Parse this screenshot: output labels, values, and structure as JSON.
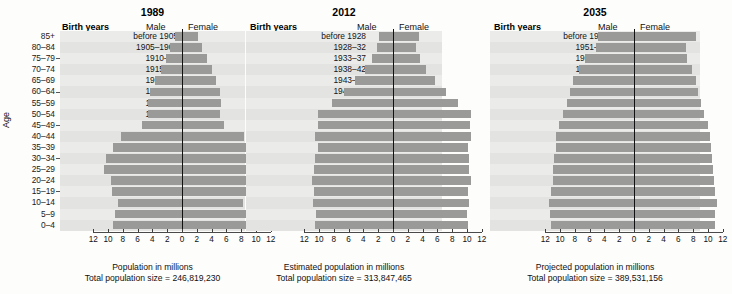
{
  "figure": {
    "y_axis_label": "Age",
    "age_groups": [
      "85+",
      "80–84",
      "75–79",
      "70–74",
      "65–69",
      "60–64",
      "55–59",
      "50–54",
      "45–49",
      "40–44",
      "35–39",
      "30–34",
      "25–29",
      "20–24",
      "15–19",
      "10–14",
      "5–9",
      "0–4"
    ],
    "column_headers": {
      "birth_years": "Birth years",
      "male": "Male",
      "female": "Female"
    },
    "tick_labels": [
      "12",
      "10",
      "8",
      "6",
      "4",
      "2",
      "0",
      "2",
      "4",
      "6",
      "8",
      "10",
      "12"
    ]
  },
  "chart_data": {
    "type": "bar",
    "xlabel": "Population in millions",
    "ylabel": "Age",
    "xlim": [
      -12,
      12
    ],
    "grid": false,
    "legend_position": "top",
    "categories": [
      "85+",
      "80–84",
      "75–79",
      "70–74",
      "65–69",
      "60–64",
      "55–59",
      "50–54",
      "45–49",
      "40–44",
      "35–39",
      "30–34",
      "25–29",
      "20–24",
      "15–19",
      "10–14",
      "5–9",
      "0–4"
    ],
    "panels": [
      {
        "year": "1989",
        "xlabel": "Population in millions",
        "total_label": "Total population size = 246,819,230",
        "total_population": "246,819,230",
        "birth_years": [
          "before 1905",
          "1905–1909",
          "1910–14",
          "1915–19",
          "1920–24",
          "1925–29",
          "1930–34",
          "1935–39",
          "1940–44",
          "1945–49",
          "1950–54",
          "1955–59",
          "1960–64",
          "1965–69",
          "1970–74",
          "1975–79",
          "1980–84",
          "1985–89"
        ],
        "series": [
          {
            "name": "Male",
            "values": [
              1.0,
              1.6,
              2.2,
              2.8,
              3.6,
              4.3,
              4.6,
              4.6,
              5.4,
              8.2,
              9.3,
              10.3,
              10.6,
              9.6,
              9.4,
              8.6,
              9.1,
              9.3
            ]
          },
          {
            "name": "Female",
            "values": [
              2.1,
              2.7,
              3.4,
              4.0,
              4.6,
              5.2,
              5.3,
              5.2,
              5.7,
              8.4,
              9.4,
              10.4,
              10.7,
              9.6,
              9.3,
              8.3,
              8.7,
              8.9
            ]
          }
        ]
      },
      {
        "year": "2012",
        "xlabel": "Estimated population in millions",
        "total_label": "Total population size = 313,847,465",
        "total_population": "313,847,465",
        "birth_years": [
          "before 1928",
          "1928–32",
          "1933–37",
          "1938–42",
          "1943–47",
          "1948–52",
          "1953–57",
          "1958–62",
          "1963–67",
          "1968–72",
          "1973–77",
          "1978–82",
          "1983–87",
          "1988–92",
          "1993–97",
          "1998–2002",
          "2003–2007",
          "2008–2012"
        ],
        "series": [
          {
            "name": "Male",
            "values": [
              1.9,
              2.1,
              2.9,
              3.8,
              5.1,
              6.6,
              8.3,
              10.2,
              10.2,
              10.6,
              10.2,
              10.5,
              10.7,
              10.9,
              10.7,
              10.8,
              10.4,
              10.5
            ]
          },
          {
            "name": "Female",
            "values": [
              3.5,
              3.1,
              3.6,
              4.4,
              5.7,
              7.1,
              8.8,
              10.5,
              10.4,
              10.6,
              10.2,
              10.3,
              10.3,
              10.5,
              10.2,
              10.3,
              10.0,
              10.1
            ]
          }
        ]
      },
      {
        "year": "2035",
        "xlabel": "Projected population in millions",
        "total_label": "Total population size = 389,531,156",
        "total_population": "389,531,156",
        "birth_years": [
          "before 1951",
          "1951–55",
          "1956–60",
          "1961–65",
          "1966–70",
          "1971–75",
          "1976–80",
          "1981–85",
          "1986–90",
          "1991–95",
          "1996–2000",
          "2001–05",
          "2006–10",
          "2011–15",
          "2016–20",
          "2021–25",
          "2026–30",
          "2031–35"
        ],
        "series": [
          {
            "name": "Male",
            "values": [
              4.8,
              5.2,
              6.6,
              7.5,
              8.3,
              8.6,
              9.1,
              9.6,
              10.2,
              10.5,
              10.6,
              10.8,
              10.9,
              11.0,
              11.2,
              11.5,
              11.3,
              11.2
            ]
          },
          {
            "name": "Female",
            "values": [
              8.4,
              7.0,
              7.2,
              7.9,
              8.4,
              8.7,
              9.0,
              9.5,
              10.0,
              10.3,
              10.4,
              10.6,
              10.7,
              10.8,
              10.9,
              11.2,
              11.0,
              10.9
            ]
          }
        ]
      }
    ]
  }
}
